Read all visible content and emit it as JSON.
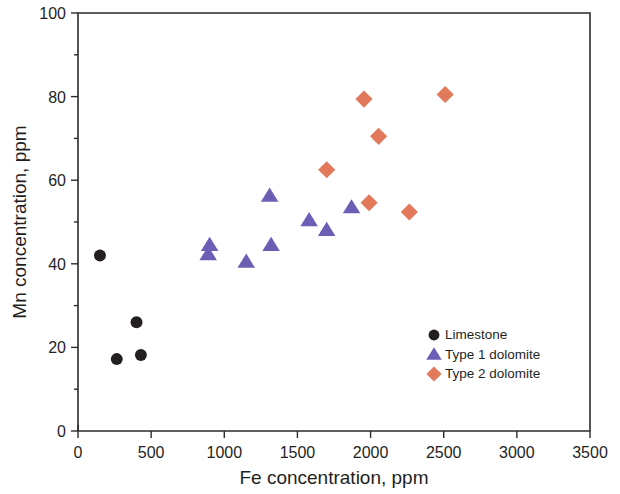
{
  "chart_data": {
    "type": "scatter",
    "title": "",
    "xlabel": "Fe concentration, ppm",
    "ylabel": "Mn concentration, ppm",
    "xlim": [
      0,
      3500
    ],
    "ylim": [
      0,
      100
    ],
    "xticks": [
      0,
      500,
      1000,
      1500,
      2000,
      2500,
      3000,
      3500
    ],
    "yticks": [
      0,
      20,
      40,
      60,
      80,
      100
    ],
    "xtick_labels": [
      "0",
      "500",
      "1000",
      "1500",
      "2000",
      "2500",
      "3000",
      "3500"
    ],
    "ytick_labels": [
      "0",
      "20",
      "40",
      "60",
      "80",
      "100"
    ],
    "grid": false,
    "legend_position": "inside-lower-right",
    "series": [
      {
        "name": "Limestone",
        "marker": "circle",
        "color": "#231f20",
        "points": [
          {
            "x": 150,
            "y": 42.0
          },
          {
            "x": 400,
            "y": 26.0
          },
          {
            "x": 265,
            "y": 17.2
          },
          {
            "x": 430,
            "y": 18.2
          }
        ]
      },
      {
        "name": "Type 1 dolomite",
        "marker": "triangle",
        "color": "#6a5fb5",
        "points": [
          {
            "x": 900,
            "y": 44.5
          },
          {
            "x": 890,
            "y": 42.3
          },
          {
            "x": 1150,
            "y": 40.5
          },
          {
            "x": 1310,
            "y": 56.3
          },
          {
            "x": 1320,
            "y": 44.5
          },
          {
            "x": 1580,
            "y": 50.4
          },
          {
            "x": 1700,
            "y": 48.1
          },
          {
            "x": 1870,
            "y": 53.5
          }
        ]
      },
      {
        "name": "Type 2 dolomite",
        "marker": "diamond",
        "color": "#e2795a",
        "points": [
          {
            "x": 1700,
            "y": 62.5
          },
          {
            "x": 1955,
            "y": 79.4
          },
          {
            "x": 2055,
            "y": 70.5
          },
          {
            "x": 1990,
            "y": 54.6
          },
          {
            "x": 2265,
            "y": 52.4
          },
          {
            "x": 2510,
            "y": 80.5
          }
        ]
      }
    ]
  },
  "legend": {
    "entries": [
      {
        "label": "Limestone"
      },
      {
        "label": "Type 1 dolomite"
      },
      {
        "label": "Type 2 dolomite"
      }
    ]
  },
  "colors": {
    "limestone": "#231f20",
    "type1_dolomite": "#6a5fb5",
    "type2_dolomite": "#e2795a",
    "axis": "#2b2b2b",
    "background": "#ffffff"
  }
}
